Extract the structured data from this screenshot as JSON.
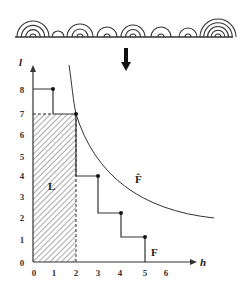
{
  "figure": {
    "arches_row": {
      "baseline_y": 37,
      "baseline_x_start": 15,
      "baseline_x_end": 233,
      "arches": [
        {
          "cx": 33,
          "outer_r": 16,
          "rings": 4
        },
        {
          "cx": 58,
          "outer_r": 6,
          "rings": 1
        },
        {
          "cx": 80,
          "outer_r": 13,
          "rings": 3
        },
        {
          "cx": 107,
          "outer_r": 10,
          "rings": 2
        },
        {
          "cx": 133,
          "outer_r": 12,
          "rings": 3
        },
        {
          "cx": 161,
          "outer_r": 10,
          "rings": 2
        },
        {
          "cx": 188,
          "outer_r": 9,
          "rings": 2
        },
        {
          "cx": 218,
          "outer_r": 18,
          "rings": 5
        }
      ]
    },
    "transform_arrow": "down-arrow",
    "axes": {
      "y_label": "l",
      "x_label": "h",
      "y_ticks": [
        "0",
        "1",
        "2",
        "3",
        "4",
        "5",
        "6",
        "7",
        "8"
      ],
      "x_ticks": [
        "0",
        "1",
        "2",
        "3",
        "4",
        "5",
        "6"
      ]
    },
    "curve_label": "F̂",
    "step_label": "F",
    "region_label": "L"
  },
  "chart_data": {
    "type": "line",
    "title": "",
    "xlabel": "h",
    "ylabel": "l",
    "xlim": [
      0,
      7
    ],
    "ylim": [
      0,
      9
    ],
    "grid": false,
    "series": [
      {
        "name": "F",
        "kind": "step",
        "points": [
          [
            0,
            8
          ],
          [
            1,
            8
          ],
          [
            1,
            7
          ],
          [
            2,
            7
          ],
          [
            2,
            4
          ],
          [
            3,
            4
          ],
          [
            3,
            2.3
          ],
          [
            4,
            2.3
          ],
          [
            4,
            1.2
          ],
          [
            5,
            1.2
          ],
          [
            5,
            0
          ]
        ],
        "markers": [
          [
            1,
            8
          ],
          [
            2,
            7
          ],
          [
            3,
            4
          ],
          [
            4,
            2.3
          ],
          [
            5,
            1.2
          ]
        ]
      },
      {
        "name": "F̂",
        "kind": "hyperbola-envelope",
        "points": [
          [
            1.6,
            9.2
          ],
          [
            2,
            7
          ],
          [
            3,
            4.7
          ],
          [
            4,
            3.4
          ],
          [
            5,
            2.8
          ],
          [
            6,
            2.4
          ],
          [
            6.5,
            2.1
          ]
        ]
      }
    ],
    "shaded_region": {
      "name": "L",
      "x": [
        0,
        2
      ],
      "y": [
        0,
        7
      ],
      "pattern": "diagonal-hatch"
    }
  }
}
